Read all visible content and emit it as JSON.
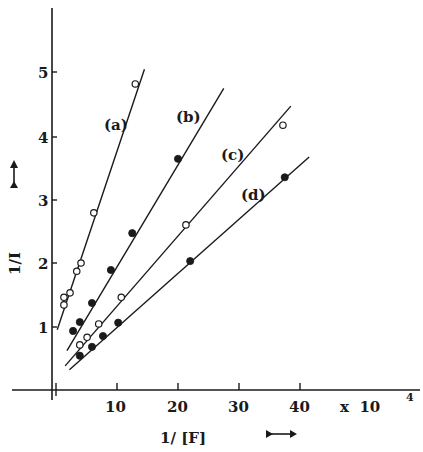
{
  "chart_data": {
    "type": "scatter",
    "title": "",
    "xlabel": "1/[F]",
    "ylabel": "1/I",
    "x_multiplier": "x 10^4",
    "x_multiplier_base": "x 10",
    "x_multiplier_exp": "4",
    "xlim": [
      0,
      42
    ],
    "ylim": [
      0,
      6
    ],
    "xticks": [
      10,
      20,
      30,
      40
    ],
    "yticks": [
      1,
      2,
      3,
      4,
      5
    ],
    "grid": false,
    "legend": "inline labels (a)-(d) next to each line",
    "series": [
      {
        "name": "(a)",
        "marker": "open-circle",
        "fit": "linear",
        "x": [
          1.3,
          1.3,
          2.3,
          3.4,
          4.1,
          6.2,
          13.0
        ],
        "y": [
          1.34,
          1.46,
          1.53,
          1.87,
          2.0,
          2.79,
          4.82
        ],
        "line": {
          "x0": 0.2,
          "y0": 0.95,
          "x1": 14.5,
          "y1": 5.05
        }
      },
      {
        "name": "(b)",
        "marker": "filled-circle",
        "fit": "linear",
        "x": [
          2.8,
          3.9,
          5.9,
          9.0,
          12.5,
          20.0
        ],
        "y": [
          0.93,
          1.07,
          1.37,
          1.89,
          2.47,
          3.64
        ],
        "line": {
          "x0": 1.8,
          "y0": 0.62,
          "x1": 27.5,
          "y1": 4.75
        }
      },
      {
        "name": "(c)",
        "marker": "open-circle",
        "fit": "linear",
        "x": [
          3.9,
          5.1,
          7.0,
          10.7,
          21.3,
          37.2
        ],
        "y": [
          0.71,
          0.83,
          1.04,
          1.46,
          2.6,
          4.17
        ],
        "line": {
          "x0": 1.5,
          "y0": 0.38,
          "x1": 38.5,
          "y1": 4.47
        }
      },
      {
        "name": "(d)",
        "marker": "filled-circle",
        "fit": "linear",
        "x": [
          3.9,
          5.9,
          7.7,
          10.2,
          22.0,
          37.5
        ],
        "y": [
          0.54,
          0.68,
          0.85,
          1.06,
          2.03,
          3.35
        ],
        "line": {
          "x0": 2.2,
          "y0": 0.32,
          "x1": 41.5,
          "y1": 3.67
        }
      }
    ]
  },
  "labels": {
    "y_ticks": [
      "1",
      "2",
      "3",
      "4",
      "5"
    ],
    "x_ticks": [
      "10",
      "20",
      "30",
      "40"
    ],
    "x_axis_title": "1/ [F]",
    "y_axis_title": "1/I",
    "multiplier_base": "x  10",
    "multiplier_exp": "4",
    "series": [
      "(a)",
      "(b)",
      "(c)",
      "(d)"
    ]
  }
}
